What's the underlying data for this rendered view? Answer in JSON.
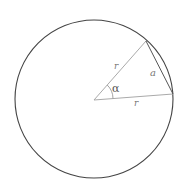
{
  "diagram": {
    "circle": {
      "cx": 94,
      "cy": 99,
      "r": 79,
      "stroke": "#444444",
      "stroke_width": 1.1
    },
    "center_vertex": {
      "x": 94,
      "y": 100
    },
    "radius_top_end": {
      "x": 146,
      "y": 41
    },
    "radius_right_end": {
      "x": 173,
      "y": 94
    },
    "radius_stroke": "#aaaaaa",
    "chord_stroke": "#555555",
    "angle_arc_stroke": "#999999",
    "labels": {
      "radius_upper": "r",
      "radius_lower": "r",
      "chord": "a",
      "angle": "α"
    }
  }
}
